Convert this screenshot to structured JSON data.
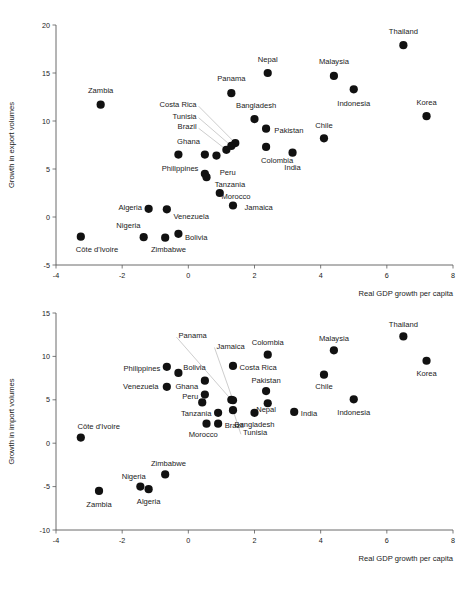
{
  "chart_data": [
    {
      "type": "scatter",
      "id": "export",
      "title": "",
      "xlabel": "Real GDP growth per capita",
      "ylabel": "Growth in export volumes",
      "xlim": [
        -4,
        8
      ],
      "ylim": [
        -5,
        20
      ],
      "xticks": [
        -4,
        -2,
        0,
        2,
        4,
        6,
        8
      ],
      "xtick_labels": [
        "-4",
        "-2",
        "0",
        "2",
        "4",
        "6",
        "8"
      ],
      "yticks": [
        -5,
        0,
        5,
        10,
        15,
        20
      ],
      "ytick_labels": [
        "-5",
        "0",
        "5",
        "10",
        "15",
        "20"
      ],
      "grid": false,
      "legend": "none",
      "points": [
        {
          "label": "Thailand",
          "x": 6.5,
          "y": 17.9,
          "lx": 6.5,
          "ly": 19.3,
          "anchor": "middle",
          "leader": false
        },
        {
          "label": "Nepal",
          "x": 2.4,
          "y": 15.0,
          "lx": 2.4,
          "ly": 16.4,
          "anchor": "middle",
          "leader": false
        },
        {
          "label": "Malaysia",
          "x": 4.4,
          "y": 14.7,
          "lx": 4.4,
          "ly": 16.2,
          "anchor": "middle",
          "leader": false
        },
        {
          "label": "Indonesia",
          "x": 5.0,
          "y": 13.3,
          "lx": 5.0,
          "ly": 11.8,
          "anchor": "middle",
          "leader": false
        },
        {
          "label": "Panama",
          "x": 1.3,
          "y": 12.9,
          "lx": 1.3,
          "ly": 14.4,
          "anchor": "middle",
          "leader": false
        },
        {
          "label": "Zambia",
          "x": -2.65,
          "y": 11.7,
          "lx": -2.65,
          "ly": 13.2,
          "anchor": "middle",
          "leader": false
        },
        {
          "label": "Korea",
          "x": 7.2,
          "y": 10.5,
          "lx": 7.2,
          "ly": 11.9,
          "anchor": "middle",
          "leader": false
        },
        {
          "label": "Bangladesh",
          "x": 2.0,
          "y": 10.2,
          "lx": 2.05,
          "ly": 11.6,
          "anchor": "middle",
          "leader": false
        },
        {
          "label": "Pakistan",
          "x": 2.35,
          "y": 9.2,
          "lx": 2.6,
          "ly": 9.0,
          "anchor": "start",
          "leader": false
        },
        {
          "label": "Chile",
          "x": 4.1,
          "y": 8.2,
          "lx": 4.1,
          "ly": 9.6,
          "anchor": "middle",
          "leader": false
        },
        {
          "label": "Costa Rica",
          "x": 1.42,
          "y": 7.7,
          "lx": 0.25,
          "ly": 11.7,
          "anchor": "end",
          "leader": true
        },
        {
          "label": "Tunisia",
          "x": 1.3,
          "y": 7.4,
          "lx": 0.25,
          "ly": 10.5,
          "anchor": "end",
          "leader": true
        },
        {
          "label": "Brazil",
          "x": 1.15,
          "y": 7.0,
          "lx": 0.25,
          "ly": 9.4,
          "anchor": "end",
          "leader": true
        },
        {
          "label": "Colombia",
          "x": 2.35,
          "y": 7.3,
          "lx": 2.2,
          "ly": 5.9,
          "anchor": "start",
          "leader": false
        },
        {
          "label": "India",
          "x": 3.15,
          "y": 6.7,
          "lx": 3.15,
          "ly": 5.2,
          "anchor": "middle",
          "leader": false
        },
        {
          "label": "Ghana",
          "x": 0.5,
          "y": 6.5,
          "lx": 0.35,
          "ly": 7.9,
          "anchor": "end",
          "leader": false
        },
        {
          "label": "Philippines",
          "x": -0.3,
          "y": 6.5,
          "lx": -0.25,
          "ly": 5.1,
          "anchor": "middle",
          "leader": false
        },
        {
          "label": "Peru",
          "x": 0.85,
          "y": 6.4,
          "lx": 0.95,
          "ly": 4.7,
          "anchor": "start",
          "leader": false
        },
        {
          "label": "Tanzania",
          "x": 0.5,
          "y": 4.5,
          "lx": 0.8,
          "ly": 3.4,
          "anchor": "start",
          "leader": false
        },
        {
          "label": "Morocco",
          "x": 0.55,
          "y": 4.15,
          "lx": 1.0,
          "ly": 2.2,
          "anchor": "start",
          "leader": false
        },
        {
          "label": "Jamaica",
          "x": 0.95,
          "y": 2.5,
          "lx": 1.7,
          "ly": 1.0,
          "anchor": "start",
          "leader": false
        },
        {
          "label": "Algeria",
          "x": -1.2,
          "y": 0.85,
          "lx": -1.4,
          "ly": 1.05,
          "anchor": "end",
          "leader": false
        },
        {
          "label": "Venezuela",
          "x": -0.65,
          "y": 0.8,
          "lx": -0.45,
          "ly": 0.1,
          "anchor": "start",
          "leader": false
        },
        {
          "label": "Nigeria",
          "x": -1.35,
          "y": -2.1,
          "lx": -1.45,
          "ly": -0.9,
          "anchor": "end",
          "leader": false
        },
        {
          "label": "Zimbabwe",
          "x": -0.7,
          "y": -2.15,
          "lx": -0.6,
          "ly": -3.4,
          "anchor": "middle",
          "leader": false
        },
        {
          "label": "Bolivia",
          "x": -0.3,
          "y": -1.75,
          "lx": -0.1,
          "ly": -2.1,
          "anchor": "start",
          "leader": false
        },
        {
          "label": "Côte d'Ivoire",
          "x": -3.25,
          "y": -2.05,
          "lx": -3.4,
          "ly": -3.4,
          "anchor": "start",
          "leader": false
        },
        {
          "label": "Indonesia2",
          "x": 1.35,
          "y": 1.2,
          "lx": 1.35,
          "ly": 1.2,
          "anchor": "middle",
          "leader": false,
          "hide_label": true
        }
      ]
    },
    {
      "type": "scatter",
      "id": "import",
      "title": "",
      "xlabel": "Real GDP growth per capita",
      "ylabel": "Growth in import volumes",
      "xlim": [
        -4,
        8
      ],
      "ylim": [
        -10,
        15
      ],
      "xticks": [
        -4,
        -2,
        0,
        2,
        4,
        6,
        8
      ],
      "xtick_labels": [
        "-4",
        "-2",
        "0",
        "2",
        "4",
        "6",
        "8"
      ],
      "yticks": [
        -10,
        -5,
        0,
        5,
        10,
        15
      ],
      "ytick_labels": [
        "-10",
        "-5",
        "0",
        "5",
        "10",
        "15"
      ],
      "grid": false,
      "legend": "none",
      "points": [
        {
          "label": "Thailand",
          "x": 6.5,
          "y": 12.3,
          "lx": 6.5,
          "ly": 13.7,
          "anchor": "middle",
          "leader": false
        },
        {
          "label": "Malaysia",
          "x": 4.4,
          "y": 10.7,
          "lx": 4.4,
          "ly": 12.1,
          "anchor": "middle",
          "leader": false
        },
        {
          "label": "Colombia",
          "x": 2.4,
          "y": 10.2,
          "lx": 2.4,
          "ly": 11.6,
          "anchor": "middle",
          "leader": false
        },
        {
          "label": "Korea",
          "x": 7.2,
          "y": 9.5,
          "lx": 7.2,
          "ly": 8.1,
          "anchor": "middle",
          "leader": false
        },
        {
          "label": "Costa Rica",
          "x": 1.35,
          "y": 8.9,
          "lx": 1.55,
          "ly": 8.7,
          "anchor": "start",
          "leader": false
        },
        {
          "label": "Philippines",
          "x": -0.65,
          "y": 8.8,
          "lx": -0.85,
          "ly": 8.6,
          "anchor": "end",
          "leader": false
        },
        {
          "label": "Bolivia",
          "x": -0.3,
          "y": 8.1,
          "lx": -0.15,
          "ly": 8.7,
          "anchor": "start",
          "leader": false
        },
        {
          "label": "Chile",
          "x": 4.1,
          "y": 7.9,
          "lx": 4.1,
          "ly": 6.5,
          "anchor": "middle",
          "leader": false
        },
        {
          "label": "Ghana",
          "x": 0.5,
          "y": 7.2,
          "lx": 0.3,
          "ly": 6.6,
          "anchor": "end",
          "leader": false
        },
        {
          "label": "Venezuela",
          "x": -0.65,
          "y": 6.5,
          "lx": -0.9,
          "ly": 6.5,
          "anchor": "end",
          "leader": false
        },
        {
          "label": "Pakistan",
          "x": 2.35,
          "y": 6.0,
          "lx": 2.35,
          "ly": 7.3,
          "anchor": "middle",
          "leader": false
        },
        {
          "label": "Peru",
          "x": 0.5,
          "y": 5.6,
          "lx": 0.3,
          "ly": 5.4,
          "anchor": "end",
          "leader": false
        },
        {
          "label": "Panama",
          "x": 1.3,
          "y": 5.0,
          "lx": -0.3,
          "ly": 12.4,
          "anchor": "start",
          "leader": true
        },
        {
          "label": "Jamaica",
          "x": 1.35,
          "y": 4.95,
          "lx": 0.85,
          "ly": 11.2,
          "anchor": "start",
          "leader": true
        },
        {
          "label": "Indonesia",
          "x": 5.0,
          "y": 5.05,
          "lx": 5.0,
          "ly": 3.6,
          "anchor": "middle",
          "leader": false
        },
        {
          "label": "Nepal",
          "x": 2.4,
          "y": 4.6,
          "lx": 2.35,
          "ly": 3.9,
          "anchor": "middle",
          "leader": false
        },
        {
          "label": "Peru2",
          "x": 0.42,
          "y": 4.7,
          "lx": 0.42,
          "ly": 4.7,
          "anchor": "middle",
          "leader": false,
          "hide_label": true
        },
        {
          "label": "Tunisia",
          "x": 1.35,
          "y": 3.8,
          "lx": 1.65,
          "ly": 1.2,
          "anchor": "start",
          "leader": true
        },
        {
          "label": "India",
          "x": 3.2,
          "y": 3.6,
          "lx": 3.4,
          "ly": 3.4,
          "anchor": "start",
          "leader": false
        },
        {
          "label": "Tanzania",
          "x": 0.9,
          "y": 3.5,
          "lx": 0.7,
          "ly": 3.4,
          "anchor": "end",
          "leader": false
        },
        {
          "label": "Bangladesh",
          "x": 2.0,
          "y": 3.5,
          "lx": 2.0,
          "ly": 2.2,
          "anchor": "middle",
          "leader": false
        },
        {
          "label": "Brazil",
          "x": 0.9,
          "y": 2.25,
          "lx": 1.1,
          "ly": 2.1,
          "anchor": "start",
          "leader": false
        },
        {
          "label": "Morocco",
          "x": 0.55,
          "y": 2.25,
          "lx": 0.45,
          "ly": 1.0,
          "anchor": "middle",
          "leader": false
        },
        {
          "label": "Côte d'Ivoire",
          "x": -3.25,
          "y": 0.65,
          "lx": -3.35,
          "ly": 2.0,
          "anchor": "start",
          "leader": false
        },
        {
          "label": "Zimbabwe",
          "x": -0.7,
          "y": -3.6,
          "lx": -0.6,
          "ly": -2.3,
          "anchor": "middle",
          "leader": false
        },
        {
          "label": "Nigeria",
          "x": -1.45,
          "y": -5.0,
          "lx": -1.65,
          "ly": -3.8,
          "anchor": "middle",
          "leader": false
        },
        {
          "label": "Algeria",
          "x": -1.2,
          "y": -5.3,
          "lx": -1.2,
          "ly": -6.7,
          "anchor": "middle",
          "leader": false
        },
        {
          "label": "Zambia",
          "x": -2.7,
          "y": -5.5,
          "lx": -2.7,
          "ly": -7.0,
          "anchor": "middle",
          "leader": false
        }
      ]
    }
  ]
}
